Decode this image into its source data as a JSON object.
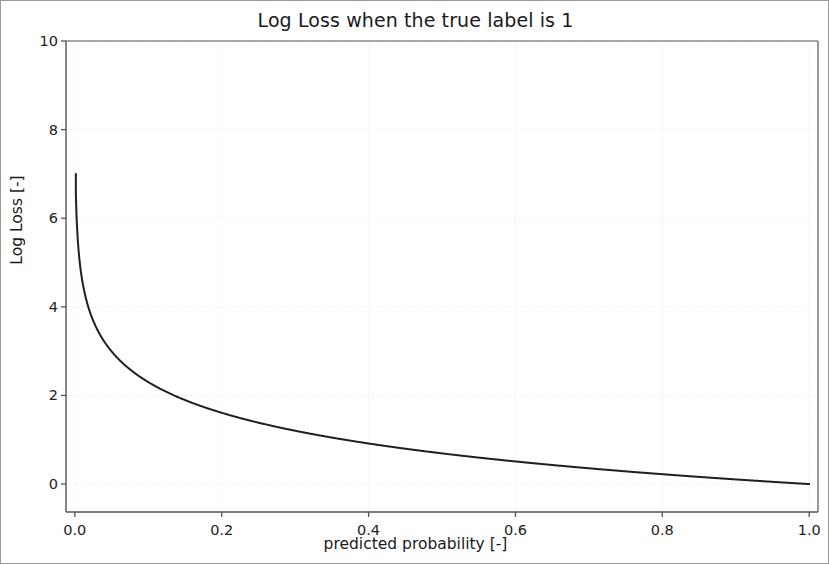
{
  "chart_data": {
    "type": "line",
    "title": "Log Loss when the true label is 1",
    "xlabel": "predicted probability [-]",
    "ylabel": "Log Loss [-]",
    "xlim": [
      -0.012,
      1.012
    ],
    "ylim": [
      -0.63,
      10.0
    ],
    "grid": true,
    "legend": null,
    "xticks": [
      0.0,
      0.2,
      0.4,
      0.6,
      0.8,
      1.0
    ],
    "xticklabels": [
      "0.0",
      "0.2",
      "0.4",
      "0.6",
      "0.8",
      "1.0"
    ],
    "yticks": [
      0,
      2,
      4,
      6,
      8,
      10
    ],
    "yticklabels": [
      "0",
      "2",
      "4",
      "6",
      "8",
      "10"
    ],
    "line_color": "#1f1f1f",
    "line_width": 2.0,
    "grid_color": "#e6e6e6",
    "axes_color": "#555555",
    "series": [
      {
        "name": "-log(p)",
        "x": [
          0.001,
          0.005,
          0.01,
          0.015,
          0.02,
          0.03,
          0.04,
          0.05,
          0.06,
          0.08,
          0.1,
          0.12,
          0.14,
          0.16,
          0.18,
          0.2,
          0.24,
          0.28,
          0.32,
          0.36,
          0.4,
          0.44,
          0.48,
          0.52,
          0.56,
          0.6,
          0.64,
          0.68,
          0.72,
          0.76,
          0.8,
          0.84,
          0.88,
          0.92,
          0.96,
          1.0
        ],
        "y": [
          6.908,
          5.298,
          4.605,
          4.2,
          3.912,
          3.507,
          3.219,
          2.996,
          2.813,
          2.526,
          2.303,
          2.12,
          1.966,
          1.833,
          1.715,
          1.609,
          1.427,
          1.273,
          1.139,
          1.022,
          0.916,
          0.821,
          0.734,
          0.654,
          0.58,
          0.511,
          0.446,
          0.386,
          0.329,
          0.274,
          0.223,
          0.174,
          0.128,
          0.083,
          0.041,
          0.0
        ],
        "y_start_visible": 7.0
      }
    ]
  },
  "axes": {
    "plot_left": 65,
    "plot_right": 817,
    "plot_top": 40,
    "plot_bottom": 511
  }
}
